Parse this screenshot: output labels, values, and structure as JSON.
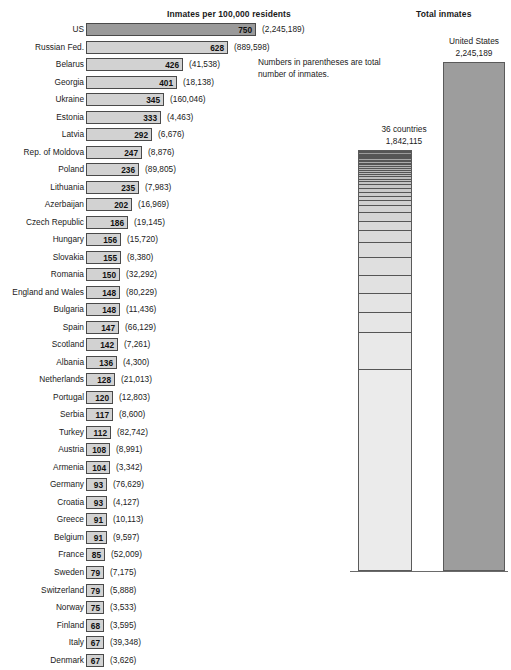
{
  "titles": {
    "left": "Inmates per 100,000 residents",
    "right": "Total inmates"
  },
  "footnote": "Numbers in parentheses are total number of inmates.",
  "right_panel": {
    "countries_caption_line1": "36 countries",
    "countries_caption_line2": "1,842,115",
    "us_caption_line1": "United States",
    "us_caption_line2": "2,245,189"
  },
  "colors": {
    "bar_fill": "#d2d2d2",
    "bar_fill_highlight": "#9a9a9a",
    "bar_border": "#4a4a4a",
    "us_total_fill": "#9d9d9d",
    "countries_total_fill": "#e2e2e2",
    "text": "#1a1a1a"
  },
  "chart_data": {
    "type": "bar",
    "title": "Inmates per 100,000 residents",
    "xlabel": "",
    "ylabel": "",
    "orientation": "horizontal",
    "xlim": [
      0,
      750
    ],
    "grid": false,
    "legend": null,
    "note": "Numbers in parentheses are total number of inmates.",
    "categories": [
      "US",
      "Russian Fed.",
      "Belarus",
      "Georgia",
      "Ukraine",
      "Estonia",
      "Latvia",
      "Rep. of Moldova",
      "Poland",
      "Lithuania",
      "Azerbaijan",
      "Czech Republic",
      "Hungary",
      "Slovakia",
      "Romania",
      "England and Wales",
      "Bulgaria",
      "Spain",
      "Scotland",
      "Albania",
      "Netherlands",
      "Portugal",
      "Serbia",
      "Turkey",
      "Austria",
      "Armenia",
      "Germany",
      "Croatia",
      "Greece",
      "Belgium",
      "France",
      "Sweden",
      "Switzerland",
      "Norway",
      "Finland",
      "Italy",
      "Denmark"
    ],
    "values": [
      750,
      628,
      426,
      401,
      345,
      333,
      292,
      247,
      236,
      235,
      202,
      186,
      156,
      155,
      150,
      148,
      148,
      147,
      142,
      136,
      128,
      120,
      117,
      112,
      108,
      104,
      93,
      93,
      91,
      91,
      85,
      79,
      79,
      75,
      68,
      67,
      67
    ],
    "totals": [
      "2,245,189",
      "889,598",
      "41,538",
      "18,138",
      "160,046",
      "4,463",
      "6,676",
      "8,876",
      "89,805",
      "7,983",
      "16,969",
      "19,145",
      "15,720",
      "8,380",
      "32,292",
      "80,229",
      "11,436",
      "66,129",
      "7,261",
      "4,300",
      "21,013",
      "12,803",
      "8,600",
      "82,742",
      "8,991",
      "3,342",
      "76,629",
      "4,127",
      "10,113",
      "9,597",
      "52,009",
      "7,175",
      "5,888",
      "3,533",
      "3,595",
      "39,348",
      "3,626"
    ],
    "secondary_chart": {
      "type": "bar",
      "title": "Total inmates",
      "categories": [
        "36 countries",
        "United States"
      ],
      "values": [
        1842115,
        2245189
      ],
      "value_labels": [
        "1,842,115",
        "2,245,189"
      ],
      "stacked_first_bar": true
    }
  },
  "rows": [
    {
      "label": "US",
      "value": "750",
      "total": "(2,245,189)"
    },
    {
      "label": "Russian Fed.",
      "value": "628",
      "total": "(889,598)"
    },
    {
      "label": "Belarus",
      "value": "426",
      "total": "(41,538)"
    },
    {
      "label": "Georgia",
      "value": "401",
      "total": "(18,138)"
    },
    {
      "label": "Ukraine",
      "value": "345",
      "total": "(160,046)"
    },
    {
      "label": "Estonia",
      "value": "333",
      "total": "(4,463)"
    },
    {
      "label": "Latvia",
      "value": "292",
      "total": "(6,676)"
    },
    {
      "label": "Rep. of Moldova",
      "value": "247",
      "total": "(8,876)"
    },
    {
      "label": "Poland",
      "value": "236",
      "total": "(89,805)"
    },
    {
      "label": "Lithuania",
      "value": "235",
      "total": "(7,983)"
    },
    {
      "label": "Azerbaijan",
      "value": "202",
      "total": "(16,969)"
    },
    {
      "label": "Czech Republic",
      "value": "186",
      "total": "(19,145)"
    },
    {
      "label": "Hungary",
      "value": "156",
      "total": "(15,720)"
    },
    {
      "label": "Slovakia",
      "value": "155",
      "total": "(8,380)"
    },
    {
      "label": "Romania",
      "value": "150",
      "total": "(32,292)"
    },
    {
      "label": "England and Wales",
      "value": "148",
      "total": "(80,229)"
    },
    {
      "label": "Bulgaria",
      "value": "148",
      "total": "(11,436)"
    },
    {
      "label": "Spain",
      "value": "147",
      "total": "(66,129)"
    },
    {
      "label": "Scotland",
      "value": "142",
      "total": "(7,261)"
    },
    {
      "label": "Albania",
      "value": "136",
      "total": "(4,300)"
    },
    {
      "label": "Netherlands",
      "value": "128",
      "total": "(21,013)"
    },
    {
      "label": "Portugal",
      "value": "120",
      "total": "(12,803)"
    },
    {
      "label": "Serbia",
      "value": "117",
      "total": "(8,600)"
    },
    {
      "label": "Turkey",
      "value": "112",
      "total": "(82,742)"
    },
    {
      "label": "Austria",
      "value": "108",
      "total": "(8,991)"
    },
    {
      "label": "Armenia",
      "value": "104",
      "total": "(3,342)"
    },
    {
      "label": "Germany",
      "value": "93",
      "total": "(76,629)"
    },
    {
      "label": "Croatia",
      "value": "93",
      "total": "(4,127)"
    },
    {
      "label": "Greece",
      "value": "91",
      "total": "(10,113)"
    },
    {
      "label": "Belgium",
      "value": "91",
      "total": "(9,597)"
    },
    {
      "label": "France",
      "value": "85",
      "total": "(52,009)"
    },
    {
      "label": "Sweden",
      "value": "79",
      "total": "(7,175)"
    },
    {
      "label": "Switzerland",
      "value": "79",
      "total": "(5,888)"
    },
    {
      "label": "Norway",
      "value": "75",
      "total": "(3,533)"
    },
    {
      "label": "Finland",
      "value": "68",
      "total": "(3,595)"
    },
    {
      "label": "Italy",
      "value": "67",
      "total": "(39,348)"
    },
    {
      "label": "Denmark",
      "value": "67",
      "total": "(3,626)"
    }
  ]
}
